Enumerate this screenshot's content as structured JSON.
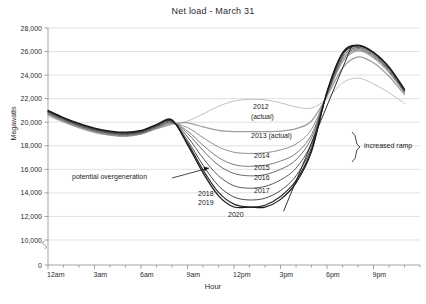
{
  "chart": {
    "title": "Net load - March 31",
    "xlabel": "Hour",
    "ylabel": "Megawatts"
  },
  "annotations": {
    "overgeneration": "potential overgeneration",
    "increased_ramp": "increased ramp",
    "y2012": "2012",
    "y2012_sub": "(actual)",
    "y2013": "2013 (actual)",
    "y2014": "2014",
    "y2015": "2015",
    "y2016": "2016",
    "y2017": "2017",
    "y2018": "2018",
    "y2019": "2019",
    "y2020": "2020"
  },
  "chart_data": {
    "type": "line",
    "title": "Net load - March 31",
    "xlabel": "Hour",
    "ylabel": "Megawatts",
    "ylim": [
      0,
      28000
    ],
    "ytick_labels": [
      "28,000",
      "26,000",
      "24,000",
      "22,000",
      "20,000",
      "18,000",
      "16,000",
      "14,000",
      "12,000",
      "10,000",
      "0"
    ],
    "ytick_values": [
      28000,
      26000,
      24000,
      22000,
      20000,
      18000,
      16000,
      14000,
      12000,
      10000,
      0
    ],
    "axis_break": true,
    "grid": true,
    "legend": "inline-labels",
    "xtick_labels": [
      "12am",
      "3am",
      "6am",
      "9am",
      "12pm",
      "3pm",
      "6pm",
      "9pm"
    ],
    "xtick_hours": [
      0,
      3,
      6,
      9,
      12,
      15,
      18,
      21
    ],
    "x": [
      0,
      1,
      2,
      3,
      4,
      5,
      6,
      7,
      8,
      9,
      10,
      11,
      12,
      13,
      14,
      15,
      16,
      17,
      18,
      19,
      20,
      21,
      22,
      23
    ],
    "series": [
      {
        "name": "2012 (actual)",
        "color": "#bdbdbd",
        "values": [
          20500,
          20000,
          19500,
          19100,
          18900,
          18850,
          19050,
          19450,
          19800,
          20100,
          20700,
          21350,
          21800,
          21950,
          21900,
          21650,
          21300,
          21200,
          22000,
          23350,
          23750,
          23250,
          22500,
          21600
        ]
      },
      {
        "name": "2013 (actual)",
        "color": "#9e9e9e",
        "values": [
          20650,
          20050,
          19550,
          19150,
          18900,
          18800,
          19000,
          19450,
          19850,
          19950,
          19600,
          19300,
          19200,
          19200,
          19200,
          19250,
          19450,
          20100,
          22200,
          24600,
          25550,
          25050,
          23900,
          22350
        ]
      },
      {
        "name": "2014",
        "color": "#8a8a8a",
        "values": [
          20700,
          20100,
          19600,
          19200,
          18950,
          18850,
          19000,
          19500,
          19900,
          19550,
          18700,
          17900,
          17450,
          17350,
          17400,
          17650,
          18150,
          19400,
          22300,
          25100,
          26050,
          25450,
          24200,
          22500
        ]
      },
      {
        "name": "2015",
        "color": "#757575",
        "values": [
          20750,
          20150,
          19650,
          19250,
          19000,
          18900,
          19050,
          19550,
          19950,
          19250,
          18050,
          17000,
          16400,
          16250,
          16350,
          16700,
          17350,
          18950,
          22350,
          25250,
          26150,
          25550,
          24300,
          22550
        ]
      },
      {
        "name": "2016",
        "color": "#636363",
        "values": [
          20800,
          20200,
          19700,
          19300,
          19050,
          18950,
          19100,
          19600,
          20000,
          19050,
          17600,
          16350,
          15650,
          15450,
          15550,
          16000,
          16800,
          18650,
          22400,
          25400,
          26250,
          25650,
          24400,
          22600
        ]
      },
      {
        "name": "2017",
        "color": "#525252",
        "values": [
          20850,
          20250,
          19750,
          19350,
          19100,
          19000,
          19150,
          19650,
          20050,
          18750,
          16950,
          15450,
          14600,
          14400,
          14550,
          15100,
          16100,
          18250,
          22450,
          25550,
          26350,
          25750,
          24500,
          22650
        ]
      },
      {
        "name": "2018",
        "color": "#3f3f3f",
        "values": [
          20900,
          20300,
          19800,
          19400,
          19150,
          19050,
          19200,
          19700,
          20100,
          18450,
          16350,
          14600,
          13650,
          13400,
          13550,
          14200,
          15450,
          17900,
          22500,
          25700,
          26450,
          25850,
          24600,
          22700
        ]
      },
      {
        "name": "2019",
        "color": "#2e2e2e",
        "values": [
          20950,
          20350,
          19850,
          19450,
          19200,
          19100,
          19250,
          19750,
          20150,
          18250,
          15950,
          14050,
          13050,
          12800,
          12950,
          13700,
          15050,
          17650,
          22550,
          25800,
          26500,
          25900,
          24650,
          22750
        ]
      },
      {
        "name": "2020",
        "color": "#1a1a1a",
        "values": [
          21000,
          20400,
          19900,
          19500,
          19250,
          19150,
          19300,
          19800,
          20200,
          18100,
          15700,
          13750,
          12800,
          12800,
          12800,
          13450,
          14850,
          17500,
          22600,
          25900,
          26550,
          25950,
          24700,
          22800
        ]
      }
    ],
    "ramp_line": {
      "label": "increased ramp",
      "from": {
        "hour": 15.2,
        "value": 12450
      },
      "to": {
        "hour": 19.6,
        "value": 26500
      }
    }
  }
}
